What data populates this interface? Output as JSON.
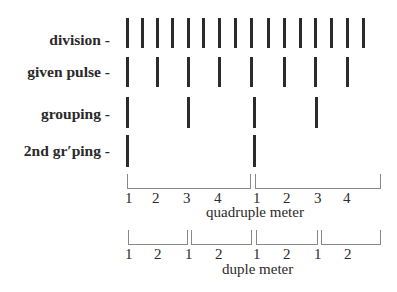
{
  "rows": [
    {
      "label": "division -",
      "y_top": 18,
      "height": 30,
      "x": [
        127,
        142,
        157,
        172,
        188,
        203,
        219,
        235,
        251,
        268,
        284,
        300,
        315,
        331,
        347,
        363
      ]
    },
    {
      "label": "given pulse -",
      "y_top": 57,
      "height": 30,
      "x": [
        127,
        157,
        188,
        219,
        251,
        284,
        315,
        347
      ]
    },
    {
      "label": "grouping -",
      "y_top": 97,
      "height": 31,
      "x": [
        127,
        188,
        254,
        316
      ]
    },
    {
      "label": "2nd gr′ping -",
      "y_top": 135,
      "height": 32,
      "x": [
        127,
        254
      ]
    }
  ],
  "quadruple": {
    "caption": "quadruple meter",
    "brackets": [
      {
        "left": 127,
        "right": 251
      },
      {
        "left": 255,
        "right": 381
      }
    ],
    "numbers": [
      {
        "text": "1",
        "x": 125
      },
      {
        "text": "2",
        "x": 152
      },
      {
        "text": "3",
        "x": 183
      },
      {
        "text": "4",
        "x": 214
      },
      {
        "text": "1",
        "x": 253
      },
      {
        "text": "2",
        "x": 283
      },
      {
        "text": "3",
        "x": 314
      },
      {
        "text": "4",
        "x": 343
      }
    ]
  },
  "duple": {
    "caption": "duple meter",
    "brackets": [
      {
        "left": 128,
        "right": 188
      },
      {
        "left": 191,
        "right": 252
      },
      {
        "left": 256,
        "right": 318
      },
      {
        "left": 321,
        "right": 381
      }
    ],
    "numbers": [
      {
        "text": "1",
        "x": 125
      },
      {
        "text": "2",
        "x": 154
      },
      {
        "text": "1",
        "x": 185
      },
      {
        "text": "2",
        "x": 215
      },
      {
        "text": "1",
        "x": 253
      },
      {
        "text": "2",
        "x": 283
      },
      {
        "text": "1",
        "x": 314
      },
      {
        "text": "2",
        "x": 344
      }
    ]
  }
}
